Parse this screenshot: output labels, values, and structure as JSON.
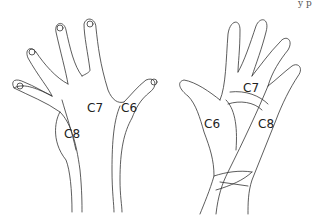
{
  "diagram": {
    "type": "dermatome-hand",
    "cut_text": "y p",
    "dorsal_hand": {
      "labels": [
        {
          "id": "c7",
          "text": "C7",
          "x": 87,
          "y": 109
        },
        {
          "id": "c6",
          "text": "C6",
          "x": 121,
          "y": 109
        },
        {
          "id": "c8",
          "text": "C8",
          "x": 64,
          "y": 131
        }
      ]
    },
    "palmar_hand": {
      "labels": [
        {
          "id": "c7",
          "text": "C7",
          "x": 243,
          "y": 83
        },
        {
          "id": "c6",
          "text": "C6",
          "x": 205,
          "y": 119
        },
        {
          "id": "c8",
          "text": "C8",
          "x": 258,
          "y": 119
        }
      ]
    },
    "line_color": "#333333"
  }
}
